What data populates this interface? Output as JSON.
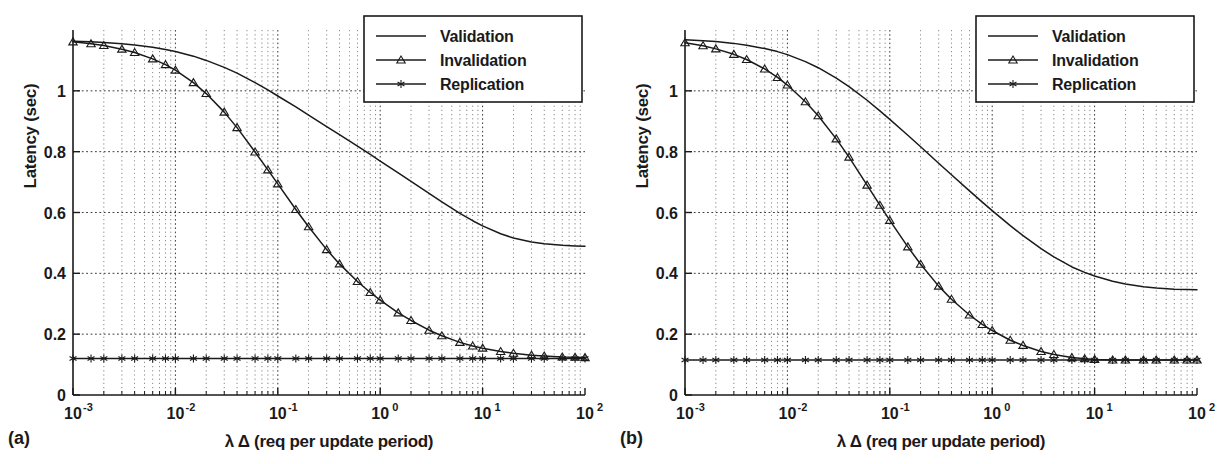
{
  "figure": {
    "panels": [
      {
        "id": "a",
        "label": "(a)",
        "legend": {
          "entries": [
            {
              "name": "Validation",
              "marker": "none"
            },
            {
              "name": "Invalidation",
              "marker": "triangle"
            },
            {
              "name": "Replication",
              "marker": "star"
            }
          ]
        }
      },
      {
        "id": "b",
        "label": "(b)",
        "legend": {
          "entries": [
            {
              "name": "Validation",
              "marker": "none"
            },
            {
              "name": "Invalidation",
              "marker": "triangle"
            },
            {
              "name": "Replication",
              "marker": "star"
            }
          ]
        }
      }
    ]
  },
  "chart_data": [
    {
      "type": "line",
      "panel": "a",
      "title": "",
      "xlabel": "λ Δ (req per update period)",
      "ylabel": "Latency (sec)",
      "xscale": "log",
      "yscale": "linear",
      "xlim": [
        0.001,
        100
      ],
      "ylim": [
        0,
        1.2
      ],
      "grid": true,
      "grid_style": "dotted",
      "legend_position": "top-right",
      "xticks": [
        0.001,
        0.01,
        0.1,
        1,
        10,
        100
      ],
      "xtick_labels": [
        "10^-3",
        "10^-2",
        "10^-1",
        "10^0",
        "10^1",
        "10^2"
      ],
      "yticks": [
        0,
        0.2,
        0.4,
        0.6,
        0.8,
        1
      ],
      "ytick_labels": [
        "0",
        "0.2",
        "0.4",
        "0.6",
        "0.8",
        "1"
      ],
      "x": [
        0.001,
        0.0015,
        0.002,
        0.003,
        0.004,
        0.006,
        0.008,
        0.01,
        0.015,
        0.02,
        0.03,
        0.04,
        0.06,
        0.08,
        0.1,
        0.15,
        0.2,
        0.3,
        0.4,
        0.6,
        0.8,
        1,
        1.5,
        2,
        3,
        4,
        6,
        8,
        10,
        15,
        20,
        30,
        40,
        60,
        80,
        100
      ],
      "series": [
        {
          "name": "Validation",
          "marker": "none",
          "values": [
            1.163,
            1.161,
            1.159,
            1.155,
            1.151,
            1.143,
            1.136,
            1.129,
            1.114,
            1.1,
            1.077,
            1.058,
            1.027,
            1.003,
            0.983,
            0.947,
            0.92,
            0.882,
            0.856,
            0.818,
            0.791,
            0.769,
            0.73,
            0.702,
            0.663,
            0.635,
            0.597,
            0.573,
            0.556,
            0.53,
            0.516,
            0.503,
            0.497,
            0.492,
            0.49,
            0.489
          ]
        },
        {
          "name": "Invalidation",
          "marker": "triangle",
          "values": [
            1.161,
            1.155,
            1.149,
            1.137,
            1.126,
            1.105,
            1.086,
            1.068,
            1.027,
            0.991,
            0.93,
            0.879,
            0.799,
            0.74,
            0.694,
            0.61,
            0.553,
            0.478,
            0.431,
            0.373,
            0.337,
            0.312,
            0.27,
            0.245,
            0.213,
            0.195,
            0.173,
            0.161,
            0.154,
            0.143,
            0.137,
            0.131,
            0.128,
            0.125,
            0.124,
            0.123
          ]
        },
        {
          "name": "Replication",
          "marker": "star",
          "values": [
            0.12,
            0.12,
            0.12,
            0.12,
            0.12,
            0.12,
            0.12,
            0.12,
            0.12,
            0.12,
            0.12,
            0.12,
            0.12,
            0.12,
            0.12,
            0.12,
            0.12,
            0.12,
            0.12,
            0.12,
            0.12,
            0.12,
            0.12,
            0.12,
            0.12,
            0.12,
            0.12,
            0.12,
            0.12,
            0.12,
            0.12,
            0.12,
            0.12,
            0.12,
            0.12,
            0.12
          ]
        }
      ]
    },
    {
      "type": "line",
      "panel": "b",
      "title": "",
      "xlabel": "λ Δ (req per update period)",
      "ylabel": "Latency (sec)",
      "xscale": "log",
      "yscale": "linear",
      "xlim": [
        0.001,
        100
      ],
      "ylim": [
        0,
        1.2
      ],
      "grid": true,
      "grid_style": "dotted",
      "legend_position": "top-right",
      "xticks": [
        0.001,
        0.01,
        0.1,
        1,
        10,
        100
      ],
      "xtick_labels": [
        "10^-3",
        "10^-2",
        "10^-1",
        "10^0",
        "10^1",
        "10^2"
      ],
      "yticks": [
        0,
        0.2,
        0.4,
        0.6,
        0.8,
        1
      ],
      "ytick_labels": [
        "0",
        "0.2",
        "0.4",
        "0.6",
        "0.8",
        "1"
      ],
      "x": [
        0.001,
        0.0015,
        0.002,
        0.003,
        0.004,
        0.006,
        0.008,
        0.01,
        0.015,
        0.02,
        0.03,
        0.04,
        0.06,
        0.08,
        0.1,
        0.15,
        0.2,
        0.3,
        0.4,
        0.6,
        0.8,
        1,
        1.5,
        2,
        3,
        4,
        6,
        8,
        10,
        15,
        20,
        30,
        40,
        60,
        80,
        100
      ],
      "series": [
        {
          "name": "Validation",
          "marker": "none",
          "values": [
            1.168,
            1.165,
            1.162,
            1.156,
            1.15,
            1.139,
            1.129,
            1.119,
            1.096,
            1.076,
            1.042,
            1.014,
            0.969,
            0.934,
            0.906,
            0.854,
            0.816,
            0.762,
            0.724,
            0.671,
            0.634,
            0.606,
            0.557,
            0.524,
            0.481,
            0.454,
            0.421,
            0.403,
            0.391,
            0.374,
            0.365,
            0.356,
            0.352,
            0.348,
            0.347,
            0.346
          ]
        },
        {
          "name": "Invalidation",
          "marker": "triangle",
          "values": [
            1.158,
            1.148,
            1.138,
            1.12,
            1.103,
            1.072,
            1.044,
            1.019,
            0.964,
            0.918,
            0.842,
            0.782,
            0.69,
            0.624,
            0.574,
            0.487,
            0.43,
            0.358,
            0.315,
            0.263,
            0.232,
            0.212,
            0.18,
            0.163,
            0.143,
            0.133,
            0.123,
            0.119,
            0.117,
            0.115,
            0.115,
            0.115,
            0.115,
            0.115,
            0.115,
            0.115
          ]
        },
        {
          "name": "Replication",
          "marker": "star",
          "values": [
            0.115,
            0.115,
            0.115,
            0.115,
            0.115,
            0.115,
            0.115,
            0.115,
            0.115,
            0.115,
            0.115,
            0.115,
            0.115,
            0.115,
            0.115,
            0.115,
            0.115,
            0.115,
            0.115,
            0.115,
            0.115,
            0.115,
            0.115,
            0.115,
            0.115,
            0.115,
            0.115,
            0.115,
            0.115,
            0.115,
            0.115,
            0.115,
            0.115,
            0.115,
            0.115,
            0.115
          ]
        }
      ]
    }
  ]
}
